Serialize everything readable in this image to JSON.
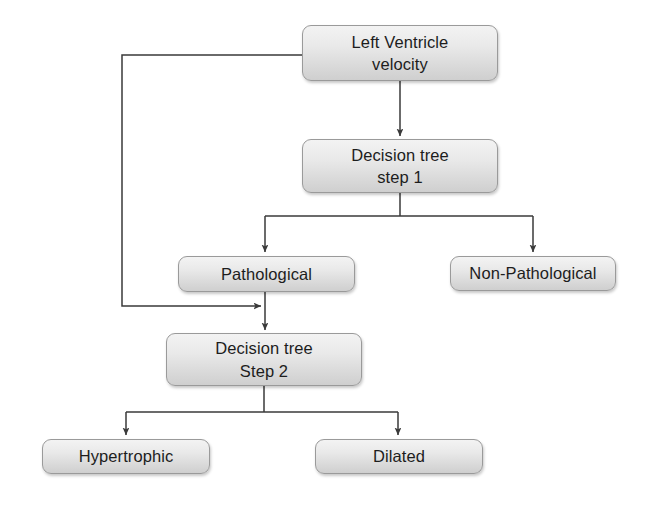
{
  "diagram": {
    "stroke_color": "#3a3a3a",
    "node_fill_top": "#f3f3f3",
    "node_fill_bottom": "#cfcfcf",
    "node_border_color": "#9a9a9a",
    "background": "#ffffff",
    "nodes": [
      {
        "id": "left-ventricle-velocity",
        "line1": "Left Ventricle",
        "line2": "velocity"
      },
      {
        "id": "decision-tree-step-1",
        "line1": "Decision tree",
        "line2": "step 1"
      },
      {
        "id": "pathological",
        "line1": "Pathological",
        "line2": ""
      },
      {
        "id": "non-pathological",
        "line1": "Non-Pathological",
        "line2": ""
      },
      {
        "id": "decision-tree-step-2",
        "line1": "Decision tree",
        "line2": "Step 2"
      },
      {
        "id": "hypertrophic",
        "line1": "Hypertrophic",
        "line2": ""
      },
      {
        "id": "dilated",
        "line1": "Dilated",
        "line2": ""
      }
    ],
    "edges": [
      {
        "id": "lv-to-dt1",
        "from": "left-ventricle-velocity",
        "to": "decision-tree-step-1",
        "arrow": true
      },
      {
        "id": "dt1-to-path",
        "from": "decision-tree-step-1",
        "to": "pathological",
        "arrow": true
      },
      {
        "id": "dt1-to-nonpath",
        "from": "decision-tree-step-1",
        "to": "non-pathological",
        "arrow": true
      },
      {
        "id": "lv-feedback-to-dt2-stem",
        "from": "left-ventricle-velocity",
        "to": "decision-tree-step-2",
        "arrow": true
      },
      {
        "id": "path-to-dt2",
        "from": "pathological",
        "to": "decision-tree-step-2",
        "arrow": true
      },
      {
        "id": "dt2-to-hyper",
        "from": "decision-tree-step-2",
        "to": "hypertrophic",
        "arrow": true
      },
      {
        "id": "dt2-to-dilated",
        "from": "decision-tree-step-2",
        "to": "dilated",
        "arrow": true
      }
    ]
  }
}
